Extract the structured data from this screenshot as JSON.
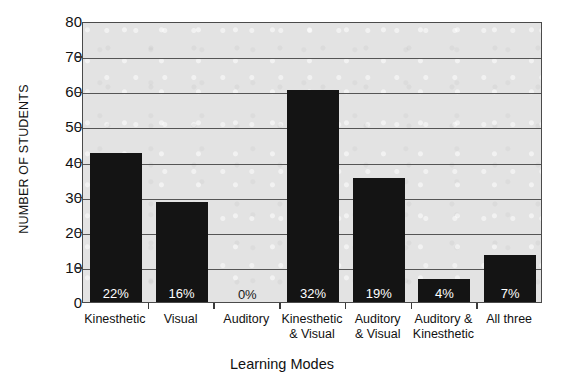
{
  "chart_data": {
    "type": "bar",
    "title": "",
    "xlabel": "Learning Modes",
    "ylabel": "NUMBER OF STUDENTS",
    "categories": [
      "Kinesthetic",
      "Visual",
      "Auditory",
      "Kinesthetic & Visual",
      "Auditory & Visual",
      "Auditory & Kinesthetic",
      "All three"
    ],
    "category_lines": [
      [
        "Kinesthetic"
      ],
      [
        "Visual"
      ],
      [
        "Auditory"
      ],
      [
        "Kinesthetic",
        "& Visual"
      ],
      [
        "Auditory",
        "& Visual"
      ],
      [
        "Auditory &",
        "Kinesthetic"
      ],
      [
        "All three"
      ]
    ],
    "values": [
      43,
      29,
      0,
      61,
      36,
      7,
      14
    ],
    "data_labels": [
      "22%",
      "16%",
      "0%",
      "32%",
      "19%",
      "4%",
      "7%"
    ],
    "ylim": [
      0,
      80
    ],
    "yticks": [
      0,
      10,
      20,
      30,
      40,
      50,
      60,
      70,
      80
    ],
    "ytick_labels": [
      "0",
      "10",
      "20",
      "30",
      "40",
      "50",
      "60",
      "70",
      "80"
    ],
    "grid": "horizontal",
    "legend": "none",
    "bar_color": "#141414",
    "plot_background": "#e3e3e3",
    "axis_color": "#4a4a4a",
    "gridline_color": "#555555",
    "data_label_color": "#ffffff"
  }
}
